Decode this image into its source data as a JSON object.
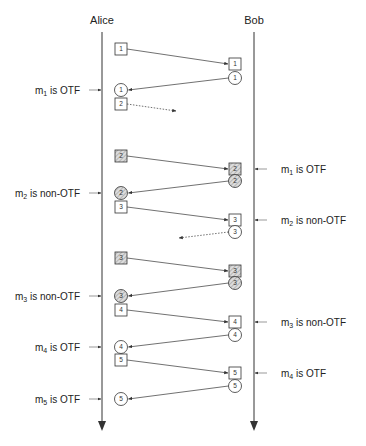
{
  "diagram": {
    "type": "sequence-diagram",
    "participants": [
      {
        "name": "Alice",
        "x": 102
      },
      {
        "name": "Bob",
        "x": 254
      }
    ],
    "left_x": 121,
    "right_x": 235,
    "messages": [
      {
        "id": "1",
        "from": "Alice",
        "to": "Bob",
        "kind": "box",
        "hatched": false,
        "y1": 49,
        "y2": 64
      },
      {
        "id": "1",
        "from": "Bob",
        "to": "Alice",
        "kind": "circle",
        "hatched": false,
        "y1": 78,
        "y2": 90
      },
      {
        "id": "2",
        "from": "Alice",
        "to": "lost",
        "kind": "box",
        "hatched": false,
        "dotted": true,
        "y1": 104,
        "y2": 111,
        "end_x": 176
      },
      {
        "id": "2",
        "from": "Alice",
        "to": "Bob",
        "kind": "box",
        "hatched": true,
        "y1": 156,
        "y2": 169
      },
      {
        "id": "2",
        "from": "Bob",
        "to": "Alice",
        "kind": "circle",
        "hatched": true,
        "y1": 181,
        "y2": 193
      },
      {
        "id": "3",
        "from": "Alice",
        "to": "Bob",
        "kind": "box",
        "hatched": false,
        "y1": 207,
        "y2": 220
      },
      {
        "id": "3",
        "from": "Bob",
        "to": "lost",
        "kind": "circle",
        "hatched": false,
        "dotted": true,
        "y1": 232,
        "y2": 238,
        "end_x": 179
      },
      {
        "id": "3",
        "from": "Alice",
        "to": "Bob",
        "kind": "box",
        "hatched": true,
        "y1": 258,
        "y2": 271
      },
      {
        "id": "3",
        "from": "Bob",
        "to": "Alice",
        "kind": "circle",
        "hatched": true,
        "y1": 283,
        "y2": 296
      },
      {
        "id": "4",
        "from": "Alice",
        "to": "Bob",
        "kind": "box",
        "hatched": false,
        "y1": 310,
        "y2": 322
      },
      {
        "id": "4",
        "from": "Bob",
        "to": "Alice",
        "kind": "circle",
        "hatched": false,
        "y1": 335,
        "y2": 347
      },
      {
        "id": "5",
        "from": "Alice",
        "to": "Bob",
        "kind": "box",
        "hatched": false,
        "y1": 360,
        "y2": 373
      },
      {
        "id": "5",
        "from": "Bob",
        "to": "Alice",
        "kind": "circle",
        "hatched": false,
        "y1": 386,
        "y2": 399
      }
    ],
    "left_annotations": [
      {
        "sub": "1",
        "status": "is OTF",
        "y": 90
      },
      {
        "sub": "2",
        "status": "is non-OTF",
        "y": 193
      },
      {
        "sub": "3",
        "status": "is non-OTF",
        "y": 296
      },
      {
        "sub": "4",
        "status": "is OTF",
        "y": 347
      },
      {
        "sub": "5",
        "status": "is OTF",
        "y": 399
      }
    ],
    "right_annotations": [
      {
        "sub": "1",
        "status": "is OTF",
        "y": 169
      },
      {
        "sub": "2",
        "status": "is non-OTF",
        "y": 220
      },
      {
        "sub": "3",
        "status": "is non-OTF",
        "y": 322
      },
      {
        "sub": "4",
        "status": "is OTF",
        "y": 373
      }
    ],
    "colors": {
      "line": "#333333",
      "shape_fill": "#ffffff",
      "hatch": "#9a9a9a",
      "hatch_bg": "#d8d8d8"
    }
  }
}
